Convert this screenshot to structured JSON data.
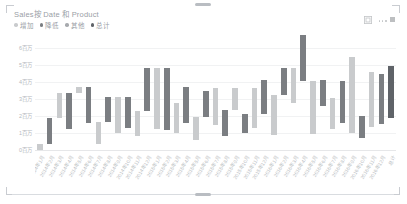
{
  "visual": {
    "title": "Sales按 Date 和 Product",
    "header_icons": [
      {
        "name": "focus-mode-icon",
        "glyph": "focus"
      },
      {
        "name": "more-options-icon",
        "glyph": "ellipsis"
      }
    ]
  },
  "legend": {
    "position": "top-left",
    "items": [
      {
        "label": "增加",
        "color": "#c9cbcd"
      },
      {
        "label": "降低",
        "color": "#7b7e82"
      },
      {
        "label": "其他",
        "color": "#a7aaae"
      },
      {
        "label": "总计",
        "color": "#5f6368"
      }
    ]
  },
  "chart_data": {
    "type": "bar",
    "title": "Sales按 Date 和 Product",
    "xlabel": "",
    "ylabel": "",
    "grid": true,
    "ylim": [
      0,
      7000000
    ],
    "yticks": [
      0,
      1000000,
      2000000,
      3000000,
      4000000,
      5000000,
      6000000
    ],
    "ytick_labels": [
      "0百万",
      "1百万",
      "2百万",
      "3百万",
      "4百万",
      "5百万",
      "6百万"
    ],
    "categories": [
      "2014年1月",
      "2014年2月",
      "2014年3月",
      "2014年4月",
      "2014年5月",
      "2014年6月",
      "2014年7月",
      "2014年8月",
      "2014年9月",
      "2014年10月",
      "2014年11月",
      "2014年12月",
      "2015年1月",
      "2015年2月",
      "2015年3月",
      "2015年4月",
      "2015年5月",
      "2015年6月",
      "2015年7月",
      "2015年8月",
      "2015年9月",
      "2015年10月",
      "2015年11月",
      "2015年12月",
      "2016年1月",
      "2016年2月",
      "2016年3月",
      "2016年4月",
      "2016年5月",
      "2016年6月",
      "2016年7月",
      "2016年8月",
      "2016年9月",
      "2016年10月",
      "2016年11月",
      "2016年12月",
      "总计"
    ],
    "series": [
      {
        "name": "waterfall",
        "bars": [
          {
            "base": 0,
            "value": 380000,
            "kind": "increase"
          },
          {
            "base": 380000,
            "value": 1480000,
            "kind": "decrease"
          },
          {
            "base": 1860000,
            "value": 1480000,
            "kind": "increase"
          },
          {
            "base": 1230000,
            "value": 2120000,
            "kind": "decrease"
          },
          {
            "base": 3350000,
            "value": 340000,
            "kind": "increase"
          },
          {
            "base": 1560000,
            "value": 2130000,
            "kind": "decrease"
          },
          {
            "base": 330000,
            "value": 1290000,
            "kind": "increase"
          },
          {
            "base": 1620000,
            "value": 1500000,
            "kind": "decrease"
          },
          {
            "base": 1000000,
            "value": 2120000,
            "kind": "increase"
          },
          {
            "base": 1300000,
            "value": 1800000,
            "kind": "decrease"
          },
          {
            "base": 800000,
            "value": 1520000,
            "kind": "increase"
          },
          {
            "base": 2320000,
            "value": 2500000,
            "kind": "decrease"
          },
          {
            "base": 1250000,
            "value": 3550000,
            "kind": "increase"
          },
          {
            "base": 1180000,
            "value": 3620000,
            "kind": "decrease"
          },
          {
            "base": 1000000,
            "value": 1760000,
            "kind": "increase"
          },
          {
            "base": 1600000,
            "value": 2100000,
            "kind": "decrease"
          },
          {
            "base": 600000,
            "value": 1350000,
            "kind": "increase"
          },
          {
            "base": 1950000,
            "value": 1550000,
            "kind": "decrease"
          },
          {
            "base": 1450000,
            "value": 2200000,
            "kind": "increase"
          },
          {
            "base": 800000,
            "value": 1550000,
            "kind": "decrease"
          },
          {
            "base": 2350000,
            "value": 1300000,
            "kind": "increase"
          },
          {
            "base": 1000000,
            "value": 1100000,
            "kind": "decrease"
          },
          {
            "base": 1300000,
            "value": 2320000,
            "kind": "increase"
          },
          {
            "base": 2100000,
            "value": 2000000,
            "kind": "decrease"
          },
          {
            "base": 900000,
            "value": 2350000,
            "kind": "increase"
          },
          {
            "base": 3250000,
            "value": 1600000,
            "kind": "decrease"
          },
          {
            "base": 2750000,
            "value": 2100000,
            "kind": "increase"
          },
          {
            "base": 4050000,
            "value": 2700000,
            "kind": "decrease"
          },
          {
            "base": 950000,
            "value": 3100000,
            "kind": "increase"
          },
          {
            "base": 2600000,
            "value": 1500000,
            "kind": "decrease"
          },
          {
            "base": 1250000,
            "value": 1800000,
            "kind": "increase"
          },
          {
            "base": 1600000,
            "value": 2450000,
            "kind": "decrease"
          },
          {
            "base": 1000000,
            "value": 4450000,
            "kind": "increase"
          },
          {
            "base": 700000,
            "value": 1300000,
            "kind": "decrease"
          },
          {
            "base": 1350000,
            "value": 3250000,
            "kind": "increase"
          },
          {
            "base": 1550000,
            "value": 2950000,
            "kind": "decrease"
          },
          {
            "base": 1900000,
            "value": 3050000,
            "kind": "total"
          }
        ]
      }
    ],
    "colors": {
      "increase": "#c9cbcd",
      "decrease": "#7b7e82",
      "other": "#a7aaae",
      "total": "#5f6368",
      "gridline": "#f1f2f3",
      "axis_text": "#b4b8bd"
    }
  }
}
